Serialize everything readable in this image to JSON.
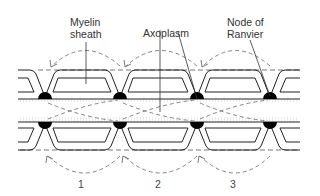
{
  "diagram": {
    "type": "saltatory-conduction-myelinated-axon",
    "labels": {
      "myelin_sheath_line1": "Myelin",
      "myelin_sheath_line2": "sheath",
      "axoplasm": "Axoplasm",
      "node_line1": "Node of",
      "node_line2": "Ranvier"
    },
    "segment_numbers": [
      "1",
      "2",
      "3"
    ],
    "nodes_x": [
      45,
      120,
      197,
      270
    ],
    "colors": {
      "line": "#222222",
      "dashed": "#555555",
      "node": "#000000",
      "background": "#ffffff"
    }
  }
}
